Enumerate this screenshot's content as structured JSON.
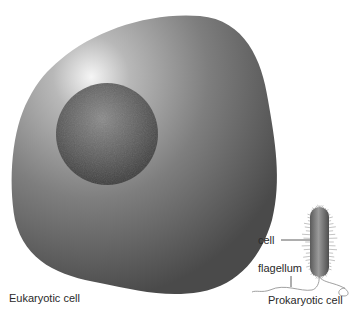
{
  "diagram": {
    "eukaryotic": {
      "label": "Eukaryotic cell"
    },
    "prokaryotic": {
      "label": "Prokaryotic cell",
      "callouts": {
        "cell": "cell",
        "flagellum": "flagellum"
      }
    }
  },
  "colors": {
    "cell_body": "#7a7a7a",
    "cell_highlight": "#f2f2f2",
    "nucleus": "#5a5a5a",
    "bacterium": "#6e6e6e",
    "text": "#2a2a2a"
  }
}
